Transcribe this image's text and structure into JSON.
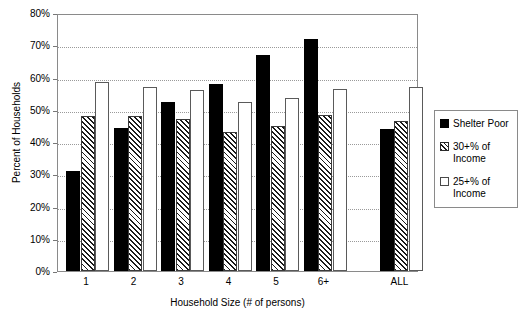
{
  "chart_data": {
    "type": "bar",
    "title": "",
    "xlabel": "Household Size (# of persons)",
    "ylabel": "Percent of Households",
    "categories": [
      "1",
      "2",
      "3",
      "4",
      "5",
      "6+",
      "ALL"
    ],
    "series": [
      {
        "name": "Shelter Poor",
        "values": [
          31,
          44.5,
          52.5,
          58,
          67,
          72,
          44
        ]
      },
      {
        "name": "30+% of Income",
        "values": [
          48,
          48,
          47,
          43,
          45,
          48.5,
          46.5
        ]
      },
      {
        "name": "25+% of Income",
        "values": [
          58.5,
          57,
          56,
          52.5,
          53.5,
          56.5,
          57
        ]
      }
    ],
    "ylim": [
      0,
      80
    ],
    "ytick_values": [
      0,
      10,
      20,
      30,
      40,
      50,
      60,
      70,
      80
    ],
    "ytick_labels": [
      "0%",
      "10%",
      "20%",
      "30%",
      "40%",
      "50%",
      "60%",
      "70%",
      "80%"
    ],
    "grid": true,
    "grid_style": "dotted-horizontal",
    "legend_position": "right",
    "colors": {
      "shelter_poor": "#000000",
      "thirty_plus": "#ffffff-hatched",
      "twentyfive_plus": "#ffffff",
      "gridline": "#9a9a9a",
      "axis": "#8a8a8a"
    }
  },
  "legend": {
    "items": [
      {
        "icon": "filled-black-square-swatch",
        "label": "Shelter Poor"
      },
      {
        "icon": "hatched-square-swatch",
        "label": "30+% of\nIncome"
      },
      {
        "icon": "empty-square-swatch",
        "label": "25+% of\nIncome"
      }
    ]
  }
}
